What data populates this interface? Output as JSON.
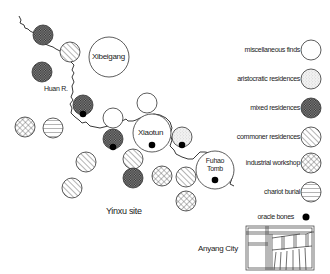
{
  "map": {
    "title": "Yinxu site",
    "river_label": "Huan R.",
    "city_label": "Anyang City",
    "site_labels": [
      {
        "name": "Xibeigang",
        "x": 109,
        "y": 57
      },
      {
        "name": "Xiaotun",
        "x": 152,
        "y": 133
      },
      {
        "name": "Fuhao Tomb",
        "x": 215,
        "y": 170
      }
    ]
  },
  "legend": {
    "items": [
      {
        "id": "misc",
        "label": "miscellaneous finds"
      },
      {
        "id": "aristocratic",
        "label": "aristocratic residences"
      },
      {
        "id": "mixed",
        "label": "mixed residences"
      },
      {
        "id": "commoner",
        "label": "commoner residences"
      },
      {
        "id": "industrial",
        "label": "industrial workshop"
      },
      {
        "id": "chariot",
        "label": "chariot burial"
      },
      {
        "id": "oracle",
        "label": "oracle bones"
      }
    ]
  },
  "fuhao_line1": "Fuhao",
  "fuhao_line2": "Tomb",
  "colors": {
    "stroke": "#333333",
    "mixed_fill": "#555555",
    "background": "#ffffff"
  }
}
